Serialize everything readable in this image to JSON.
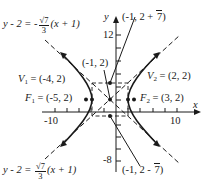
{
  "diagram": {
    "type": "hyperbola",
    "equation_center": [
      -1,
      2
    ],
    "a": 3,
    "b": "sqrt(7)",
    "c": 4,
    "orientation": "horizontal transverse axis",
    "axes": {
      "x_label": "x",
      "y_label": "y",
      "x_tick_labels": [
        "-10",
        "10"
      ],
      "y_tick_labels": [
        "12",
        "-8"
      ]
    },
    "points": {
      "center": {
        "label": "(-1, 2)",
        "x": -1,
        "y": 2
      },
      "vertex1": {
        "name": "V",
        "sub": "1",
        "label": "= (-4, 2)",
        "x": -4,
        "y": 2
      },
      "vertex2": {
        "name": "V",
        "sub": "2",
        "label": "= (2, 2)",
        "x": 2,
        "y": 2
      },
      "focus1": {
        "name": "F",
        "sub": "1",
        "label": "= (-5, 2)",
        "x": -5,
        "y": 2
      },
      "focus2": {
        "name": "F",
        "sub": "2",
        "label": "= (3, 2)",
        "x": 3,
        "y": 2
      },
      "conj_top": {
        "label_pre": "(-1, 2 + ",
        "label_rad": "7",
        "label_post": ")"
      },
      "conj_bottom": {
        "label_pre": "(-1, 2 - ",
        "label_rad": "7",
        "label_post": ")"
      }
    },
    "asymptotes": {
      "top": {
        "lhs": "y - 2 = -",
        "num": "√7",
        "den": "3",
        "rhs": "(x + 1)"
      },
      "bottom": {
        "lhs": "y - 2 = ",
        "num": "√7",
        "den": "3",
        "rhs": "(x + 1)"
      }
    },
    "colors": {
      "ink": "#1a1a1a",
      "background": "#ffffff"
    }
  }
}
